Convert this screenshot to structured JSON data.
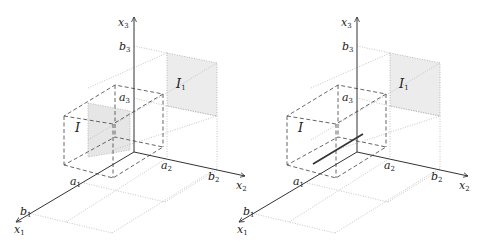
{
  "figures": [
    {
      "id": "left",
      "offset_x": 0,
      "labels": {
        "x1": "x",
        "x1_sub": "1",
        "x2": "x",
        "x2_sub": "2",
        "x3": "x",
        "x3_sub": "3",
        "a1": "a",
        "a1_sub": "1",
        "a2": "a",
        "a2_sub": "2",
        "a3": "a",
        "a3_sub": "3",
        "b1": "b",
        "b1_sub": "1",
        "b2": "b",
        "b2_sub": "2",
        "b3": "b",
        "b3_sub": "3",
        "box": "I",
        "face": "I",
        "face_sub": "1"
      },
      "has_shaded_slice": true,
      "has_solid_segment": false
    },
    {
      "id": "right",
      "offset_x": 223,
      "labels": {
        "x1": "x",
        "x1_sub": "1",
        "x2": "x",
        "x2_sub": "2",
        "x3": "x",
        "x3_sub": "3",
        "a1": "a",
        "a1_sub": "1",
        "a2": "a",
        "a2_sub": "2",
        "a3": "a",
        "a3_sub": "3",
        "b1": "b",
        "b1_sub": "1",
        "b2": "b",
        "b2_sub": "2",
        "b3": "b",
        "b3_sub": "3",
        "box": "I",
        "face": "I",
        "face_sub": "1"
      },
      "has_shaded_slice": false,
      "has_solid_segment": true
    }
  ],
  "colors": {
    "axis": "#333333",
    "dashed": "#555555",
    "dotted": "#b0b0b0",
    "shade": "#ececec",
    "segment": "#333333"
  }
}
